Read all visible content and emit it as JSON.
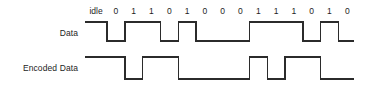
{
  "diagram": {
    "background_color": "#ffffff",
    "line_color": "#2b2b2b",
    "text_color": "#1d1d1d"
  },
  "rows": {
    "data_label": "Data",
    "encoded_label": "Encoded Data"
  },
  "bits": {
    "idle_label": "idle",
    "sequence": [
      "0",
      "1",
      "1",
      "0",
      "1",
      "0",
      "0",
      "0",
      "1",
      "1",
      "1",
      "0",
      "1",
      "0"
    ]
  },
  "chart_data": {
    "type": "line",
    "xlabel": "",
    "ylabel": "",
    "categories": [
      "idle",
      "0",
      "1",
      "1",
      "0",
      "1",
      "0",
      "0",
      "0",
      "1",
      "1",
      "1",
      "0",
      "1",
      "0"
    ],
    "series": [
      {
        "name": "Data",
        "description": "NRZ level: logic 1 is high, logic 0 is low; idle period held high",
        "values": [
          1,
          0,
          1,
          1,
          0,
          1,
          0,
          0,
          0,
          1,
          1,
          1,
          0,
          1,
          0
        ]
      },
      {
        "name": "Encoded Data",
        "description": "NRZI: signal level inverts at the start of every bit whose data value is 1, holds level for 0",
        "values": [
          1,
          1,
          0,
          1,
          1,
          0,
          0,
          0,
          0,
          1,
          0,
          1,
          1,
          0,
          0
        ]
      }
    ],
    "ylim": [
      0,
      1
    ],
    "grid": false,
    "legend": "left-axis-labels"
  },
  "geometry": {
    "bit_width_px": 17.8,
    "first_bit_left_px": 107,
    "idle_start_px": 85,
    "data_high_y_px": 22,
    "data_low_y_px": 41,
    "encoded_high_y_px": 57,
    "encoded_low_y_px": 79,
    "tail_px": 16
  }
}
